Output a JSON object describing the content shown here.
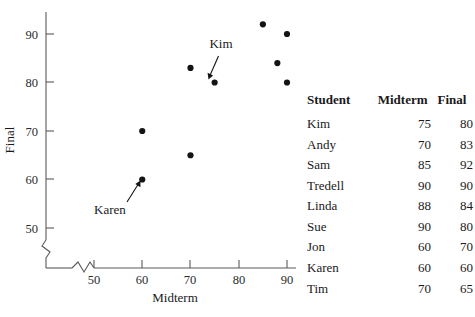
{
  "chart_data": {
    "type": "scatter",
    "title": "",
    "xlabel": "Midterm",
    "ylabel": "Final",
    "xlim": [
      45,
      92
    ],
    "ylim": [
      46,
      94
    ],
    "xticks": [
      50,
      60,
      70,
      80,
      90
    ],
    "yticks": [
      50,
      60,
      70,
      80,
      90
    ],
    "grid": false,
    "legend": "none",
    "axis_break": {
      "x": true,
      "y": true
    },
    "points": [
      {
        "label": "Kim",
        "x": 75,
        "y": 80
      },
      {
        "label": "Andy",
        "x": 70,
        "y": 83
      },
      {
        "label": "Sam",
        "x": 85,
        "y": 92
      },
      {
        "label": "Tredell",
        "x": 90,
        "y": 90
      },
      {
        "label": "Linda",
        "x": 88,
        "y": 84
      },
      {
        "label": "Sue",
        "x": 90,
        "y": 80
      },
      {
        "label": "Jon",
        "x": 60,
        "y": 70
      },
      {
        "label": "Karen",
        "x": 60,
        "y": 60
      },
      {
        "label": "Tim",
        "x": 70,
        "y": 65
      }
    ],
    "annotations": [
      {
        "text": "Kim",
        "point_x": 75,
        "point_y": 80,
        "text_x": 73.2,
        "text_y": 87.5
      },
      {
        "text": "Karen",
        "point_x": 60,
        "point_y": 60,
        "text_x": 56.0,
        "text_y": 53.5
      }
    ]
  },
  "axis": {
    "x_label": "Midterm",
    "y_label": "Final",
    "x_tick_labels": [
      "50",
      "60",
      "70",
      "80",
      "90"
    ],
    "y_tick_labels": [
      "50",
      "60",
      "70",
      "80",
      "90"
    ]
  },
  "table": {
    "headers": [
      "Student",
      "Midterm",
      "Final"
    ],
    "rows": [
      {
        "student": "Kim",
        "midterm": "75",
        "final": "80"
      },
      {
        "student": "Andy",
        "midterm": "70",
        "final": "83"
      },
      {
        "student": "Sam",
        "midterm": "85",
        "final": "92"
      },
      {
        "student": "Tredell",
        "midterm": "90",
        "final": "90"
      },
      {
        "student": "Linda",
        "midterm": "88",
        "final": "84"
      },
      {
        "student": "Sue",
        "midterm": "90",
        "final": "80"
      },
      {
        "student": "Jon",
        "midterm": "60",
        "final": "70"
      },
      {
        "student": "Karen",
        "midterm": "60",
        "final": "60"
      },
      {
        "student": "Tim",
        "midterm": "70",
        "final": "65"
      }
    ]
  },
  "colors": {
    "point": "#141414",
    "axis": "#5a5a5a",
    "text": "#1a1a1a",
    "background": "#ffffff"
  }
}
